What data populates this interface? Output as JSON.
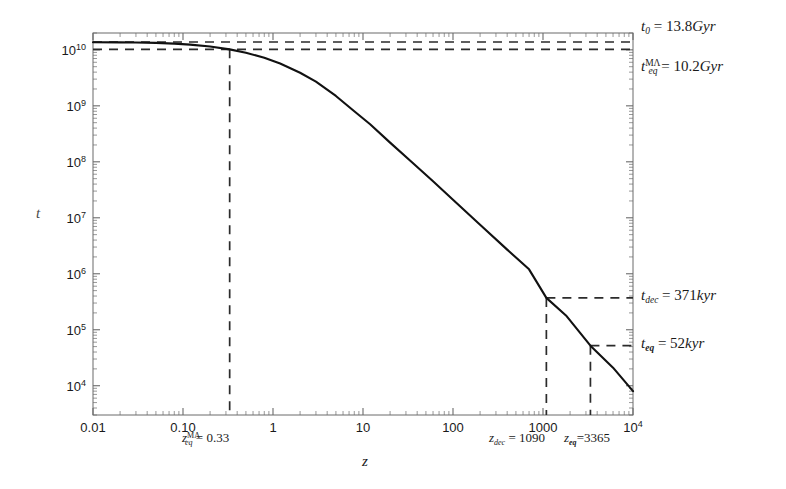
{
  "chart_data": {
    "type": "line",
    "title": "",
    "xlabel": "z",
    "ylabel": "t",
    "xscale": "log",
    "yscale": "log",
    "xlim": [
      0.01,
      10000
    ],
    "ylim": [
      3000,
      20000000000
    ],
    "grid": false,
    "legend": "none",
    "x_tick_labels": [
      "0.01",
      "0.10",
      "1",
      "10",
      "100",
      "1000",
      "10⁴"
    ],
    "x_tick_values": [
      0.01,
      0.1,
      1,
      10,
      100,
      1000,
      10000
    ],
    "y_tick_labels": [
      "10⁴",
      "10⁵",
      "10⁶",
      "10⁷",
      "10⁸",
      "10⁹",
      "10¹⁰"
    ],
    "y_tick_values": [
      10000,
      100000,
      1000000,
      10000000,
      100000000,
      1000000000,
      10000000000
    ],
    "series": [
      {
        "name": "cosmic time t(z)",
        "x": [
          0.01,
          0.02,
          0.03,
          0.05,
          0.08,
          0.12,
          0.2,
          0.33,
          0.5,
          0.8,
          1.2,
          2,
          3,
          5,
          8,
          12,
          20,
          35,
          60,
          100,
          200,
          400,
          700,
          1090,
          1800,
          3365,
          6000,
          10000
        ],
        "y": [
          13700000000,
          13600000000,
          13500000000,
          13300000000,
          12900000000,
          12400000000,
          11500000000,
          10200000000,
          8900000000,
          7200000000,
          5700000000,
          3900000000,
          2700000000,
          1500000000,
          800000000,
          470000000,
          220000000,
          98000000,
          45000000,
          21000000,
          7500000,
          2700000,
          1200000,
          371000,
          180000,
          52000,
          21000,
          8000
        ]
      }
    ],
    "annotations": [
      {
        "name": "t0",
        "label": "t_0 = 13.8 Gyr",
        "type": "hline",
        "y": 13800000000
      },
      {
        "name": "t_eq_MLambda",
        "label": "t_eq^MΛ = 10.2 Gyr",
        "type": "hline",
        "y": 10200000000
      },
      {
        "name": "z_eq_MLambda",
        "label": "z_eq^MΛ = 0.33",
        "type": "vline",
        "x": 0.33
      },
      {
        "name": "t_dec",
        "label": "t_dec = 371 kyr",
        "type": "hline",
        "y": 371000
      },
      {
        "name": "z_dec",
        "label": "z_dec = 1090",
        "type": "vline",
        "x": 1090
      },
      {
        "name": "t_eq",
        "label": "t_eq = 52 kyr",
        "type": "hline",
        "y": 52000
      },
      {
        "name": "z_eq",
        "label": "z_eq = 3365",
        "type": "vline",
        "x": 3365
      }
    ]
  },
  "axes": {
    "x_title": "z",
    "y_title": "t",
    "x_ticks": [
      {
        "label": "0.01",
        "value": 0.01
      },
      {
        "label": "0.10",
        "value": 0.1
      },
      {
        "label": "1",
        "value": 1
      },
      {
        "label": "10",
        "value": 10
      },
      {
        "label": "100",
        "value": 100
      },
      {
        "label": "1000",
        "value": 1000
      },
      {
        "label": "10",
        "exp": "4",
        "value": 10000
      }
    ],
    "y_ticks": [
      {
        "base": "10",
        "exp": "10",
        "value": 10000000000
      },
      {
        "base": "10",
        "exp": "9",
        "value": 1000000000
      },
      {
        "base": "10",
        "exp": "8",
        "value": 100000000
      },
      {
        "base": "10",
        "exp": "7",
        "value": 10000000
      },
      {
        "base": "10",
        "exp": "6",
        "value": 1000000
      },
      {
        "base": "10",
        "exp": "5",
        "value": 100000
      },
      {
        "base": "10",
        "exp": "4",
        "value": 10000
      }
    ]
  },
  "annotations": {
    "t0": {
      "symbol": "t",
      "sub": "0",
      "sup": "",
      "equals": "=",
      "value": "13.8",
      "unit": "Gyr"
    },
    "t_eq_mlambda": {
      "symbol": "t",
      "sub": "eq",
      "sup": "MΛ",
      "equals": "=",
      "value": "10.2",
      "unit": "Gyr"
    },
    "t_dec": {
      "symbol": "t",
      "sub": "dec",
      "sup": "",
      "equals": "=",
      "value": "371",
      "unit": "kyr"
    },
    "t_eq": {
      "symbol": "t",
      "sub": "eq",
      "sup": "",
      "equals": "=",
      "value": "52",
      "unit": "kyr"
    },
    "z_eq_mlambda": {
      "symbol": "z",
      "sub": "eq",
      "sup": "MΛ",
      "equals": "=",
      "value": "0.33"
    },
    "z_dec": {
      "symbol": "z",
      "sub": "dec",
      "sup": "",
      "equals": "=",
      "value": "1090"
    },
    "z_eq": {
      "symbol": "z",
      "sub": "eq",
      "sup": "",
      "equals": "=",
      "value": "3365"
    }
  },
  "colors": {
    "curve": "#111111",
    "dashed": "#2b2b2b",
    "frame": "#6b6b6b",
    "text": "#1a1a1a",
    "background": "#ffffff"
  }
}
